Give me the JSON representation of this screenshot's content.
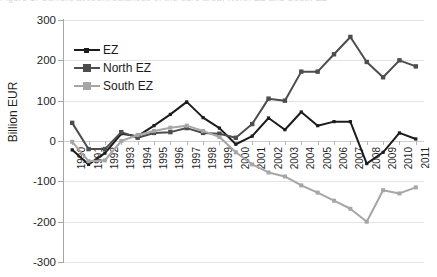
{
  "caption_ghost": "Figure 1. Current account balances of the euro area, North EZ and South EZ",
  "axis": {
    "y_title": "Billion EUR",
    "y_ticks": [
      "300",
      "200",
      "100",
      "0",
      "-100",
      "-200",
      "-300"
    ],
    "x_ticks": [
      "1990",
      "1991",
      "1992",
      "1993",
      "1994",
      "1995",
      "1996",
      "1997",
      "1998",
      "1999",
      "2000",
      "2001",
      "2002",
      "2003",
      "2004",
      "2005",
      "2006",
      "2007",
      "2008",
      "2009",
      "2010",
      "2011"
    ]
  },
  "legend": {
    "position": "inside-top-left",
    "items": [
      {
        "label": "EZ",
        "color": "#1c1c1c",
        "marker": "small-square"
      },
      {
        "label": "North EZ",
        "color": "#4d4d4d",
        "marker": "square"
      },
      {
        "label": "South EZ",
        "color": "#a6a6a6",
        "marker": "square"
      }
    ]
  },
  "colors": {
    "ez": "#1c1c1c",
    "north_ez": "#4d4d4d",
    "south_ez": "#a6a6a6",
    "gridline": "#e3e3e3",
    "axis": "#a6a6a6",
    "background": "#ffffff"
  },
  "chart_data": {
    "type": "line",
    "title": "",
    "xlabel": "",
    "ylabel": "Billion EUR",
    "ylim": [
      -300,
      300
    ],
    "ytick_step": 100,
    "grid": true,
    "legend_position": "inside-top-left",
    "x": [
      "1990",
      "1991",
      "1992",
      "1993",
      "1994",
      "1995",
      "1996",
      "1997",
      "1998",
      "1999",
      "2000",
      "2001",
      "2002",
      "2003",
      "2004",
      "2005",
      "2006",
      "2007",
      "2008",
      "2009",
      "2010",
      "2011"
    ],
    "series": [
      {
        "name": "EZ",
        "color": "#1c1c1c",
        "values": [
          -22,
          -58,
          -30,
          18,
          12,
          38,
          66,
          97,
          58,
          32,
          -8,
          12,
          57,
          28,
          72,
          38,
          48,
          48,
          -56,
          -28,
          20,
          5
        ]
      },
      {
        "name": "North EZ",
        "color": "#4d4d4d",
        "values": [
          45,
          -20,
          -20,
          22,
          8,
          20,
          22,
          32,
          20,
          18,
          8,
          42,
          105,
          100,
          172,
          172,
          215,
          258,
          196,
          158,
          200,
          185
        ]
      },
      {
        "name": "South EZ",
        "color": "#a6a6a6",
        "values": [
          -2,
          -50,
          -48,
          0,
          15,
          25,
          33,
          38,
          25,
          10,
          -28,
          -58,
          -78,
          -88,
          -110,
          -128,
          -148,
          -168,
          -200,
          -122,
          -130,
          -115
        ]
      }
    ]
  }
}
